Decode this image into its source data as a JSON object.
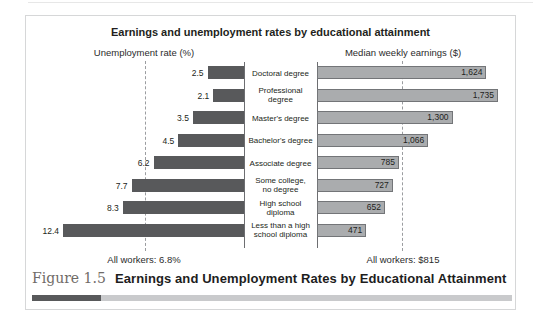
{
  "figure": {
    "caption_label": "Figure 1.5",
    "caption_title": "Earnings and Unemployment Rates by Educational Attainment"
  },
  "chart_data": {
    "type": "bar",
    "orientation": "bidirectional-horizontal",
    "title": "Earnings and unemployment rates by educational attainment",
    "left_axis_label": "Unemployment rate (%)",
    "right_axis_label": "Median weekly earnings ($)",
    "legend": "none",
    "grid": "off",
    "categories": [
      "Doctoral degree",
      "Professional degree",
      "Master's degree",
      "Bachelor's degree",
      "Associate degree",
      "Some college, no degree",
      "High school diploma",
      "Less than a high school diploma"
    ],
    "categories_display": [
      "Doctoral degree",
      "Professional\ndegree",
      "Master's degree",
      "Bachelor's degree",
      "Associate degree",
      "Some college,\nno degree",
      "High school\ndiploma",
      "Less than a high\nschool diploma"
    ],
    "series": [
      {
        "name": "Unemployment rate (%)",
        "values": [
          2.5,
          2.1,
          3.5,
          4.5,
          6.2,
          7.7,
          8.3,
          12.4
        ],
        "display": [
          "2.5",
          "2.1",
          "3.5",
          "4.5",
          "6.2",
          "7.7",
          "8.3",
          "12.4"
        ],
        "axis_range": [
          0,
          12.4
        ]
      },
      {
        "name": "Median weekly earnings ($)",
        "values": [
          1624,
          1735,
          1300,
          1066,
          785,
          727,
          652,
          471
        ],
        "display": [
          "1,624",
          "1,735",
          "1,300",
          "1,066",
          "785",
          "727",
          "652",
          "471"
        ],
        "axis_range": [
          0,
          1735
        ]
      }
    ],
    "reference_lines": {
      "unemployment_all_workers": 6.8,
      "earnings_all_workers": 815
    },
    "footnotes": {
      "left": "All workers: 6.8%",
      "right": "All workers: $815"
    },
    "colors": {
      "unemployment_bar": "#58595b",
      "earnings_bar_fill": "#aaacae",
      "earnings_bar_border": "#737578",
      "reference_line": "#9b9da0",
      "axis_line": "#6d6e71",
      "caption_label": "#6f6b67",
      "caption_rule_dark": "#58595b",
      "caption_rule_light": "#c9cacc"
    }
  }
}
